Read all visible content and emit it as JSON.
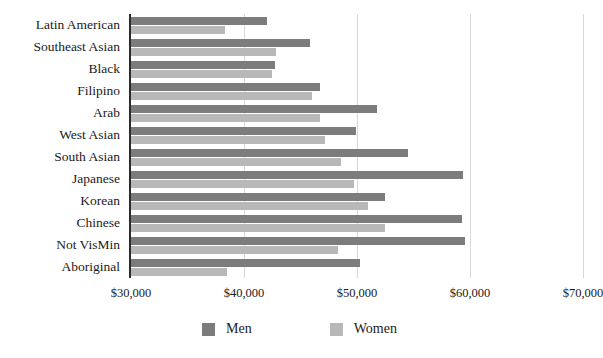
{
  "chart_data": {
    "type": "bar",
    "orientation": "horizontal",
    "title": "",
    "xlabel": "",
    "ylabel": "",
    "xlim": [
      30000,
      70000
    ],
    "grid": true,
    "legend_position": "bottom",
    "xticks": [
      {
        "value": 30000,
        "label": "$30,000"
      },
      {
        "value": 40000,
        "label": "$40,000"
      },
      {
        "value": 50000,
        "label": "$50,000"
      },
      {
        "value": 60000,
        "label": "$60,000"
      },
      {
        "value": 70000,
        "label": "$70,000"
      }
    ],
    "categories": [
      "Latin American",
      "Southeast Asian",
      "Black",
      "Filipino",
      "Arab",
      "West Asian",
      "South Asian",
      "Japanese",
      "Korean",
      "Chinese",
      "Not VisMin",
      "Aboriginal"
    ],
    "series": [
      {
        "name": "Men",
        "color": "#7c7c7c",
        "values": [
          42000,
          45800,
          42700,
          46700,
          51800,
          49900,
          54500,
          59400,
          52500,
          59300,
          59600,
          50300
        ]
      },
      {
        "name": "Women",
        "color": "#b8b8b8",
        "values": [
          38300,
          42800,
          42500,
          46000,
          46700,
          47200,
          48600,
          49700,
          51000,
          52500,
          48300,
          38500
        ]
      }
    ]
  },
  "legend": {
    "items": [
      {
        "label": "Men",
        "color": "#7c7c7c"
      },
      {
        "label": "Women",
        "color": "#b8b8b8"
      }
    ]
  }
}
